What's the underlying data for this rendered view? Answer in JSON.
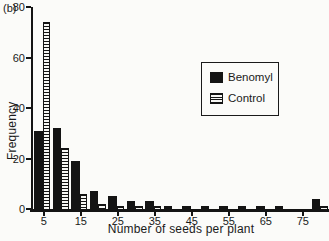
{
  "panel_label": "(b)",
  "colors": {
    "ink": "#141414",
    "paper": "#fbfbf9"
  },
  "chart_data": {
    "type": "bar",
    "title": "",
    "xlabel": "Number of seeds per plant",
    "ylabel": "Frequency",
    "categories": [
      5,
      10,
      15,
      20,
      25,
      30,
      35,
      40,
      45,
      50,
      55,
      60,
      65,
      70,
      75,
      80
    ],
    "series": [
      {
        "name": "Benomyl",
        "style": "solid",
        "values": [
          31,
          32,
          19,
          7,
          5,
          3,
          3,
          1,
          1,
          1,
          1,
          1,
          1,
          1,
          0,
          4
        ]
      },
      {
        "name": "Control",
        "style": "striped",
        "values": [
          74,
          24,
          6,
          2,
          1,
          1,
          1,
          0,
          0,
          0,
          0,
          0,
          0,
          0,
          0,
          1
        ]
      }
    ],
    "x_tick_labels": [
      5,
      15,
      25,
      35,
      45,
      55,
      65,
      75
    ],
    "y_ticks": [
      0,
      20,
      40,
      60,
      80
    ],
    "ylim": [
      0,
      80
    ],
    "grid": false,
    "legend_position": "upper-right"
  }
}
